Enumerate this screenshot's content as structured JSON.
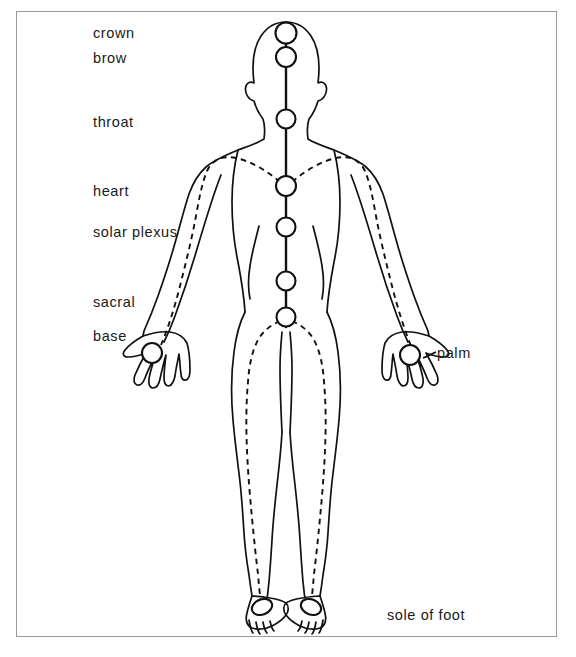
{
  "figure": {
    "frame": {
      "border_color": "#9a9a9a",
      "background": "#ffffff"
    },
    "stroke_color": "#111111",
    "body_outline_style": "solid",
    "energy_path_style": "dashed"
  },
  "labels": {
    "crown": "crown",
    "brow": "brow",
    "throat": "throat",
    "heart": "heart",
    "solar_plexus": "solar plexus",
    "sacral": "sacral",
    "base": "base",
    "palm": "palm",
    "sole_of_foot": "sole of foot"
  },
  "chakras": [
    {
      "name": "crown",
      "label": "crown",
      "cx": 286,
      "cy": 33,
      "r": 10.5,
      "side": "left"
    },
    {
      "name": "brow",
      "label": "brow",
      "cx": 286,
      "cy": 57,
      "r": 10.0,
      "side": "left"
    },
    {
      "name": "throat",
      "label": "throat",
      "cx": 286,
      "cy": 119,
      "r": 9.5,
      "side": "left"
    },
    {
      "name": "heart",
      "label": "heart",
      "cx": 286,
      "cy": 186,
      "r": 10.0,
      "side": "left"
    },
    {
      "name": "solar-plexus",
      "label": "solar plexus",
      "cx": 286,
      "cy": 227,
      "r": 9.5,
      "side": "left"
    },
    {
      "name": "sacral",
      "label": "sacral",
      "cx": 286,
      "cy": 281,
      "r": 9.5,
      "side": "left"
    },
    {
      "name": "base",
      "label": "base",
      "cx": 286,
      "cy": 317,
      "r": 9.5,
      "side": "left"
    }
  ],
  "minor_centres": [
    {
      "name": "left-palm",
      "label": "palm",
      "cx": 152,
      "cy": 353,
      "r": 10.0
    },
    {
      "name": "right-palm",
      "label": "palm",
      "cx": 410,
      "cy": 355,
      "r": 10.0
    },
    {
      "name": "left-sole",
      "label": "sole of foot",
      "cx": 262,
      "cy": 607,
      "rx": 10.5,
      "ry": 7.5
    },
    {
      "name": "right-sole",
      "label": "sole of foot",
      "cx": 311,
      "cy": 607,
      "rx": 10.5,
      "ry": 7.5
    }
  ],
  "label_positions": {
    "crown": {
      "x": 93,
      "y": 26
    },
    "brow": {
      "x": 93,
      "y": 51
    },
    "throat": {
      "x": 93,
      "y": 115
    },
    "heart": {
      "x": 93,
      "y": 184
    },
    "solar_plexus": {
      "x": 93,
      "y": 225
    },
    "sacral": {
      "x": 93,
      "y": 295
    },
    "base": {
      "x": 93,
      "y": 329
    },
    "palm": {
      "x": 437,
      "y": 346
    },
    "sole_of_foot": {
      "x": 387,
      "y": 608
    }
  }
}
